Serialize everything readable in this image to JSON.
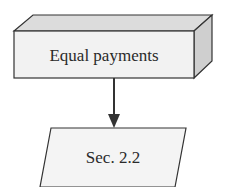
{
  "diagram": {
    "nodes": [
      {
        "id": "equal-payments",
        "shape": "3d-box",
        "label": "Equal payments"
      },
      {
        "id": "sec-2-2",
        "shape": "parallelogram",
        "label": "Sec. 2.2"
      }
    ],
    "edges": [
      {
        "from": "equal-payments",
        "to": "sec-2-2",
        "arrow": "down"
      }
    ],
    "colors": {
      "stroke": "#333333",
      "front_face": "#f2f2f2",
      "top_face": "#dcdcdc",
      "side_face": "#cfcfcf",
      "parallelogram_fill": "#f4f4f4",
      "text": "#2a2a2a"
    }
  }
}
